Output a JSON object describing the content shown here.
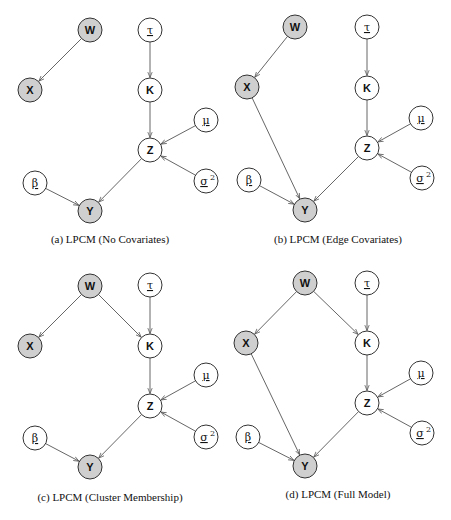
{
  "colors": {
    "observed_fill": "#cfcfcf",
    "latent_fill": "#ffffff",
    "stroke": "#333333",
    "edge": "#555555"
  },
  "nodes": {
    "W": {
      "label": "W",
      "observed": true,
      "kind": "variable"
    },
    "X": {
      "label": "X",
      "observed": true,
      "kind": "variable"
    },
    "tau": {
      "label": "τ",
      "observed": false,
      "kind": "parameter"
    },
    "K": {
      "label": "K",
      "observed": false,
      "kind": "variable"
    },
    "mu": {
      "label": "μ",
      "observed": false,
      "kind": "parameter"
    },
    "Z": {
      "label": "Z",
      "observed": false,
      "kind": "variable"
    },
    "sigma2": {
      "label": "σ",
      "sup": "2",
      "observed": false,
      "kind": "parameter"
    },
    "beta": {
      "label": "β",
      "observed": false,
      "kind": "parameter"
    },
    "Y": {
      "label": "Y",
      "observed": true,
      "kind": "variable"
    }
  },
  "panels": [
    {
      "id": "a",
      "caption": "(a) LPCM (No Covariates)",
      "edges": [
        [
          "W",
          "X"
        ],
        [
          "tau",
          "K"
        ],
        [
          "K",
          "Z"
        ],
        [
          "mu",
          "Z"
        ],
        [
          "sigma2",
          "Z"
        ],
        [
          "Z",
          "Y"
        ],
        [
          "beta",
          "Y"
        ]
      ]
    },
    {
      "id": "b",
      "caption": "(b) LPCM (Edge Covariates)",
      "edges": [
        [
          "W",
          "X"
        ],
        [
          "X",
          "Y"
        ],
        [
          "tau",
          "K"
        ],
        [
          "K",
          "Z"
        ],
        [
          "mu",
          "Z"
        ],
        [
          "sigma2",
          "Z"
        ],
        [
          "Z",
          "Y"
        ],
        [
          "beta",
          "Y"
        ]
      ]
    },
    {
      "id": "c",
      "caption": "(c) LPCM (Cluster Membership)",
      "edges": [
        [
          "W",
          "X"
        ],
        [
          "W",
          "K"
        ],
        [
          "tau",
          "K"
        ],
        [
          "K",
          "Z"
        ],
        [
          "mu",
          "Z"
        ],
        [
          "sigma2",
          "Z"
        ],
        [
          "Z",
          "Y"
        ],
        [
          "beta",
          "Y"
        ]
      ]
    },
    {
      "id": "d",
      "caption": "(d) LPCM (Full Model)",
      "edges": [
        [
          "W",
          "X"
        ],
        [
          "W",
          "K"
        ],
        [
          "X",
          "Y"
        ],
        [
          "tau",
          "K"
        ],
        [
          "K",
          "Z"
        ],
        [
          "mu",
          "Z"
        ],
        [
          "sigma2",
          "Z"
        ],
        [
          "Z",
          "Y"
        ],
        [
          "beta",
          "Y"
        ]
      ]
    }
  ]
}
